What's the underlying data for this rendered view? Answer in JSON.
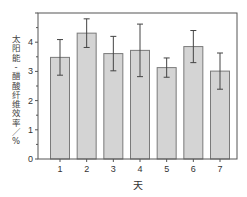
{
  "chart_data": {
    "type": "bar",
    "title": "",
    "xlabel": "天",
    "ylabel": "太阳能-醋酸纤维效率／%",
    "categories": [
      "1",
      "2",
      "3",
      "4",
      "5",
      "6",
      "7"
    ],
    "values": [
      3.48,
      4.31,
      3.61,
      3.72,
      3.13,
      3.85,
      3.01
    ],
    "errors": [
      0.61,
      0.49,
      0.59,
      0.9,
      0.33,
      0.55,
      0.62
    ],
    "ylim": [
      0,
      5
    ],
    "yticks": [
      0,
      1,
      2,
      3,
      4
    ],
    "ytick_labels": [
      "0",
      "1",
      "2",
      "3",
      "4"
    ],
    "grid": false,
    "legend": "none",
    "colors": {
      "bar_fill": "#d4d4d4",
      "bar_edge": "#7a7a7a",
      "error_bar": "#444444",
      "axis": "#555555"
    }
  }
}
